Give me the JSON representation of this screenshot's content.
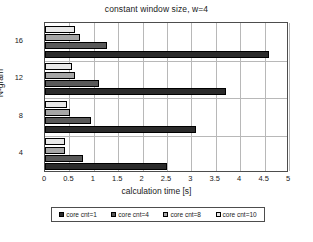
{
  "chart_data": {
    "type": "bar",
    "orientation": "horizontal",
    "title": "constant window size, w=4",
    "xlabel": "calculation time [s]",
    "ylabel": "N-gram",
    "categories": [
      "4",
      "8",
      "12",
      "16"
    ],
    "xlim": [
      0,
      5
    ],
    "xticks": [
      "0",
      "0.5",
      "1",
      "1.5",
      "2",
      "2.5",
      "3",
      "3.5",
      "4",
      "4.5",
      "5"
    ],
    "xtick_values": [
      0,
      0.5,
      1,
      1.5,
      2,
      2.5,
      3,
      3.5,
      4,
      4.5,
      5
    ],
    "grid": true,
    "legend_position": "bottom",
    "series": [
      {
        "name": "core cnt=1",
        "color": "#2b2b2b",
        "values": [
          2.5,
          3.1,
          3.7,
          4.6
        ]
      },
      {
        "name": "core cnt=4",
        "color": "#595959",
        "values": [
          0.78,
          0.95,
          1.1,
          1.27
        ]
      },
      {
        "name": "core cnt=8",
        "color": "#a6a6a6",
        "values": [
          0.42,
          0.52,
          0.62,
          0.72
        ]
      },
      {
        "name": "core cnt=10",
        "color": "#e8e8e8",
        "values": [
          0.4,
          0.45,
          0.55,
          0.62
        ]
      }
    ]
  }
}
